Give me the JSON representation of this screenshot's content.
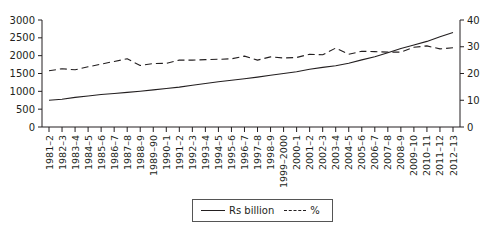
{
  "chart_data": {
    "type": "line",
    "title": "",
    "xlabel": "",
    "ylabel": "",
    "y2label": "",
    "categories": [
      "1981–2",
      "1982–3",
      "1983–4",
      "1984–5",
      "1985–6",
      "1986–7",
      "1987–8",
      "1988–9",
      "1989–90",
      "1990–1",
      "1991–2",
      "1992–3",
      "1993–4",
      "1994–5",
      "1995–6",
      "1996–7",
      "1997–8",
      "1998–9",
      "1999–2000",
      "2000–1",
      "2001–2",
      "2002–3",
      "2003–4",
      "2004–5",
      "2005–6",
      "2006–7",
      "2007–8",
      "2008–9",
      "2009–10",
      "2010–11",
      "2011–12",
      "2012–13"
    ],
    "series": [
      {
        "name": "Rs billion",
        "axis": "left",
        "style": "solid",
        "values": [
          750,
          780,
          830,
          870,
          910,
          940,
          970,
          1000,
          1040,
          1080,
          1120,
          1170,
          1220,
          1270,
          1310,
          1350,
          1400,
          1450,
          1500,
          1550,
          1620,
          1670,
          1720,
          1790,
          1880,
          1970,
          2080,
          2200,
          2300,
          2400,
          2530,
          2650
        ]
      },
      {
        "name": "%",
        "axis": "right",
        "style": "dashed",
        "values": [
          21.0,
          21.8,
          21.4,
          22.5,
          23.5,
          24.5,
          25.5,
          23.0,
          23.7,
          23.8,
          25.0,
          25.0,
          25.2,
          25.3,
          25.5,
          26.5,
          25.0,
          26.2,
          25.8,
          26.0,
          27.2,
          27.0,
          29.5,
          27.2,
          28.3,
          28.2,
          28.0,
          28.0,
          29.8,
          30.3,
          29.2,
          29.6
        ]
      }
    ],
    "ylim": [
      0,
      3000
    ],
    "yticks": [
      0,
      500,
      1000,
      1500,
      2000,
      2500,
      3000
    ],
    "y2lim": [
      0,
      40
    ],
    "y2ticks": [
      0,
      10,
      20,
      30,
      40
    ],
    "grid": false,
    "legend_position": "bottom-center"
  },
  "legend": {
    "items": [
      {
        "label": "Rs billion",
        "style": "solid"
      },
      {
        "label": "%",
        "style": "dashed"
      }
    ]
  }
}
